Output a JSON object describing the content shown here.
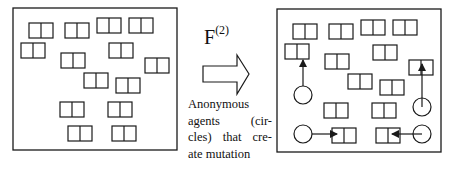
{
  "figure": {
    "colors": {
      "stroke": "#1a1a1a",
      "background": "#ffffff"
    },
    "left_panel": {
      "frame": {
        "x": 13,
        "y": 8,
        "w": 164,
        "h": 142
      },
      "cells": [
        {
          "x": 29,
          "y": 23
        },
        {
          "x": 65,
          "y": 23
        },
        {
          "x": 97,
          "y": 18
        },
        {
          "x": 129,
          "y": 18
        },
        {
          "x": 21,
          "y": 43
        },
        {
          "x": 109,
          "y": 43
        },
        {
          "x": 61,
          "y": 53
        },
        {
          "x": 145,
          "y": 58
        },
        {
          "x": 84,
          "y": 73
        },
        {
          "x": 116,
          "y": 78
        },
        {
          "x": 60,
          "y": 102
        },
        {
          "x": 108,
          "y": 102
        },
        {
          "x": 68,
          "y": 126
        },
        {
          "x": 112,
          "y": 126
        }
      ]
    },
    "transition": {
      "operator_label": "F",
      "operator_superscript": "(2)",
      "arrow_icon": "block-arrow-right",
      "caption_lines": [
        "Anonymous",
        "agents (cir-",
        "cles) that cre-",
        "ate mutation"
      ]
    },
    "right_panel": {
      "frame": {
        "x": 277,
        "y": 9,
        "w": 164,
        "h": 143
      },
      "cells": [
        {
          "x": 293,
          "y": 24
        },
        {
          "x": 329,
          "y": 24
        },
        {
          "x": 361,
          "y": 20
        },
        {
          "x": 393,
          "y": 20
        },
        {
          "x": 285,
          "y": 44
        },
        {
          "x": 373,
          "y": 45
        },
        {
          "x": 325,
          "y": 54
        },
        {
          "x": 409,
          "y": 60
        },
        {
          "x": 348,
          "y": 74
        },
        {
          "x": 380,
          "y": 80
        },
        {
          "x": 324,
          "y": 103
        },
        {
          "x": 372,
          "y": 103
        },
        {
          "x": 332,
          "y": 128
        },
        {
          "x": 376,
          "y": 128
        }
      ],
      "agents": [
        {
          "cx": 303,
          "cy": 95,
          "r": 9,
          "arrow": {
            "x1": 303,
            "y1": 86,
            "x2": 303,
            "y2": 60
          }
        },
        {
          "cx": 422,
          "cy": 107,
          "r": 9,
          "arrow": {
            "x1": 422,
            "y1": 107,
            "x2": 422,
            "y2": 64
          }
        },
        {
          "cx": 303,
          "cy": 134,
          "r": 9,
          "arrow": {
            "x1": 312,
            "y1": 134,
            "x2": 337,
            "y2": 134
          }
        },
        {
          "cx": 422,
          "cy": 134,
          "r": 9,
          "arrow": {
            "x1": 422,
            "y1": 134,
            "x2": 392,
            "y2": 134
          }
        }
      ]
    },
    "cell_size": {
      "w": 24,
      "h": 15
    }
  }
}
